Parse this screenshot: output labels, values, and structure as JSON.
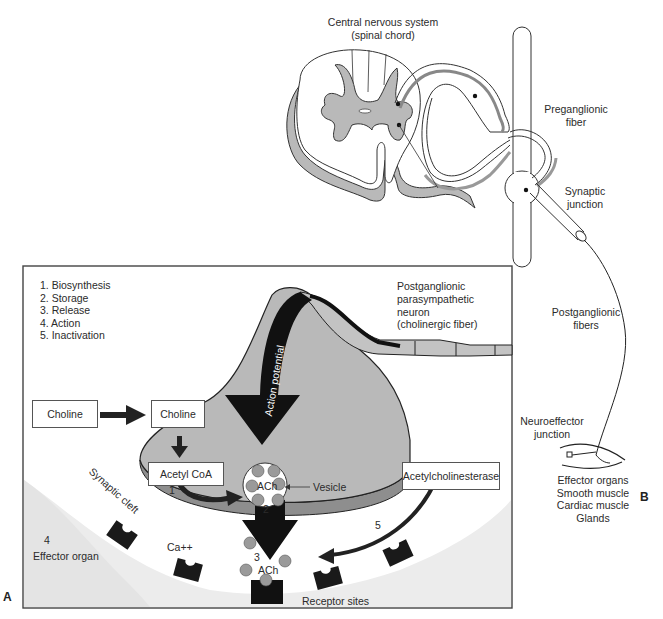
{
  "panel_b": {
    "letter": "B",
    "cns_label_line1": "Central nervous system",
    "cns_label_line2": "(spinal chord)",
    "preganglionic_line1": "Preganglionic",
    "preganglionic_line2": "fiber",
    "synaptic_junction_line1": "Synaptic",
    "synaptic_junction_line2": "junction",
    "postganglionic_fibers_line1": "Postganglionic",
    "postganglionic_fibers_line2": "fibers",
    "neuroeffector_line1": "Neuroeffector",
    "neuroeffector_line2": "junction",
    "effector_lines": [
      "Effector organs",
      "Smooth muscle",
      "Cardiac muscle",
      "Glands"
    ]
  },
  "panel_a": {
    "letter": "A",
    "steps": [
      "1. Biosynthesis",
      "2. Storage",
      "3. Release",
      "4. Action",
      "5. Inactivation"
    ],
    "neuron_label_lines": [
      "Postganglionic",
      "parasympathetic",
      "neuron",
      "(cholinergic fiber)"
    ],
    "action_potential": "Action potential",
    "choline_outside": "Choline",
    "choline_inside": "Choline",
    "acetyl_coa": "Acetyl CoA",
    "acetylcholinesterase": "Acetylcholinesterase",
    "vesicle_label": "Vesicle",
    "vesicle_content": "ACh",
    "released_ach": "ACh",
    "synaptic_cleft": "Synaptic cleft",
    "effector_organ_num": "4",
    "effector_organ": "Effector organ",
    "calcium": "Ca++",
    "receptor_sites": "Receptor sites",
    "step_markers": {
      "one": "1",
      "two": "2",
      "three": "3",
      "five": "5"
    }
  },
  "colors": {
    "gray_fill": "#b9b9b9",
    "dark_gray": "#8e8e8e",
    "black": "#111111",
    "light_bg": "#efefef",
    "vesicle_ball": "#9a9a9a"
  }
}
